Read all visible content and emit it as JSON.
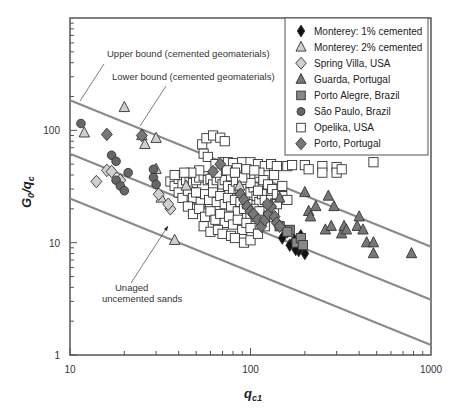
{
  "chart_data": {
    "type": "scatter",
    "title": "",
    "xlabel": "q_c1",
    "ylabel": "G0/qc",
    "xscale": "log",
    "yscale": "log",
    "xlim": [
      10,
      1000
    ],
    "ylim": [
      1,
      1000
    ],
    "x_ticks": [
      "10",
      "100",
      "1000"
    ],
    "y_ticks": [
      "1",
      "10",
      "100"
    ],
    "grid": false,
    "legend_position": "upper right",
    "lines": [
      {
        "name": "Upper bound (cemented geomaterials)",
        "points": [
          [
            10,
            185
          ],
          [
            1000,
            9.2
          ]
        ],
        "color": "#8a8a8a"
      },
      {
        "name": "Lower bound (cemented geomaterials)",
        "points": [
          [
            10,
            62
          ],
          [
            1000,
            3.1
          ]
        ],
        "color": "#8a8a8a"
      },
      {
        "name": "Unaged uncemented sands",
        "points": [
          [
            10,
            24.7
          ],
          [
            1000,
            1.23
          ]
        ],
        "color": "#8a8a8a"
      }
    ],
    "annotations": [
      {
        "text": "Upper bound (cemented geomaterials)",
        "x": 107,
        "y": 57
      },
      {
        "text": "Lower bound (cemented geomaterials)",
        "x": 112,
        "y": 80
      },
      {
        "text": "Unaged",
        "x": 115,
        "y": 291
      },
      {
        "text": "uncemented sands",
        "x": 102,
        "y": 302
      }
    ],
    "series": [
      {
        "name": "Monterey: 1% cemented",
        "marker": "diamond",
        "fill": "#111111",
        "points": [
          [
            150,
            11
          ],
          [
            165,
            9.5
          ],
          [
            175,
            10.5
          ],
          [
            185,
            8.5
          ],
          [
            190,
            11.5
          ],
          [
            200,
            8
          ],
          [
            160,
            12.5
          ],
          [
            178,
            8.7
          ]
        ]
      },
      {
        "name": "Monterey: 2% cemented",
        "marker": "triangle",
        "fill": "#cfcfcf",
        "points": [
          [
            12,
            95
          ],
          [
            20,
            160
          ],
          [
            26,
            75
          ],
          [
            30,
            85
          ],
          [
            25,
            90
          ],
          [
            32,
            25
          ],
          [
            38,
            10.5
          ],
          [
            130,
            22
          ],
          [
            44,
            32
          ],
          [
            87,
            32
          ],
          [
            30,
            45
          ]
        ]
      },
      {
        "name": "Spring Villa, USA",
        "marker": "diamond",
        "fill": "#d0d0d0",
        "points": [
          [
            14,
            35
          ],
          [
            16,
            44
          ],
          [
            19,
            36
          ],
          [
            31,
            27
          ],
          [
            36,
            20
          ],
          [
            17,
            43
          ],
          [
            35,
            22
          ]
        ]
      },
      {
        "name": "Guarda, Portugal",
        "marker": "triangle",
        "fill": "#777777",
        "points": [
          [
            145,
            25
          ],
          [
            200,
            28
          ],
          [
            210,
            19
          ],
          [
            215,
            17
          ],
          [
            230,
            21
          ],
          [
            260,
            13
          ],
          [
            280,
            14
          ],
          [
            290,
            21
          ],
          [
            320,
            12
          ],
          [
            330,
            14
          ],
          [
            340,
            13
          ],
          [
            390,
            14
          ],
          [
            420,
            13
          ],
          [
            440,
            10
          ],
          [
            480,
            8
          ],
          [
            480,
            10
          ],
          [
            780,
            8
          ],
          [
            400,
            17
          ],
          [
            270,
            26
          ]
        ]
      },
      {
        "name": "Porto Alegre, Brazil",
        "marker": "square",
        "fill": "#888888",
        "points": [
          [
            145,
            14
          ],
          [
            165,
            13
          ],
          [
            180,
            10
          ],
          [
            190,
            11
          ],
          [
            195,
            9.5
          ],
          [
            160,
            12.5
          ]
        ]
      },
      {
        "name": "São Paulo, Brazil",
        "marker": "circle",
        "fill": "#666666",
        "points": [
          [
            11.5,
            115
          ],
          [
            17,
            60
          ],
          [
            18,
            53
          ],
          [
            21,
            42
          ],
          [
            18,
            36
          ],
          [
            19,
            32
          ],
          [
            20,
            29
          ],
          [
            29,
            45
          ],
          [
            29,
            38
          ],
          [
            30,
            33
          ]
        ]
      },
      {
        "name": "Opelika, USA",
        "marker": "square",
        "fill": "#ffffff",
        "points": [
          [
            54,
            75
          ],
          [
            57,
            85
          ],
          [
            62,
            90
          ],
          [
            68,
            86
          ],
          [
            72,
            80
          ],
          [
            55,
            62
          ],
          [
            58,
            58
          ],
          [
            64,
            50
          ],
          [
            70,
            52
          ],
          [
            75,
            52
          ],
          [
            80,
            51
          ],
          [
            90,
            52
          ],
          [
            100,
            52
          ],
          [
            110,
            50
          ],
          [
            120,
            48
          ],
          [
            130,
            50
          ],
          [
            140,
            48
          ],
          [
            160,
            48
          ],
          [
            170,
            49
          ],
          [
            200,
            49
          ],
          [
            210,
            45
          ],
          [
            250,
            48
          ],
          [
            250,
            42
          ],
          [
            300,
            47
          ],
          [
            300,
            42
          ],
          [
            320,
            45
          ],
          [
            480,
            52
          ],
          [
            36,
            35
          ],
          [
            38,
            32
          ],
          [
            40,
            37
          ],
          [
            42,
            33
          ],
          [
            44,
            36
          ],
          [
            46,
            38
          ],
          [
            48,
            34
          ],
          [
            50,
            36
          ],
          [
            52,
            38
          ],
          [
            55,
            39
          ],
          [
            58,
            36
          ],
          [
            60,
            37
          ],
          [
            62,
            33
          ],
          [
            65,
            36
          ],
          [
            68,
            38
          ],
          [
            70,
            33
          ],
          [
            72,
            36
          ],
          [
            75,
            32
          ],
          [
            78,
            39
          ],
          [
            80,
            30
          ],
          [
            83,
            35
          ],
          [
            86,
            30
          ],
          [
            88,
            28
          ],
          [
            90,
            32
          ],
          [
            93,
            26
          ],
          [
            96,
            30
          ],
          [
            100,
            28
          ],
          [
            104,
            31
          ],
          [
            108,
            26
          ],
          [
            112,
            23
          ],
          [
            116,
            27
          ],
          [
            120,
            24
          ],
          [
            125,
            21
          ],
          [
            130,
            24
          ],
          [
            135,
            19
          ],
          [
            140,
            22
          ],
          [
            40,
            28
          ],
          [
            42,
            25
          ],
          [
            45,
            29
          ],
          [
            48,
            25
          ],
          [
            50,
            28
          ],
          [
            53,
            23
          ],
          [
            56,
            27
          ],
          [
            59,
            24
          ],
          [
            62,
            28
          ],
          [
            65,
            23
          ],
          [
            68,
            26
          ],
          [
            72,
            22
          ],
          [
            75,
            25
          ],
          [
            78,
            21
          ],
          [
            82,
            24
          ],
          [
            85,
            19
          ],
          [
            88,
            23
          ],
          [
            92,
            20
          ],
          [
            96,
            22
          ],
          [
            100,
            18
          ],
          [
            104,
            20
          ],
          [
            108,
            17
          ],
          [
            112,
            19
          ],
          [
            118,
            16
          ],
          [
            125,
            17
          ],
          [
            45,
            21
          ],
          [
            48,
            18
          ],
          [
            52,
            20
          ],
          [
            56,
            17
          ],
          [
            60,
            19
          ],
          [
            64,
            16
          ],
          [
            68,
            18
          ],
          [
            72,
            15
          ],
          [
            76,
            17
          ],
          [
            80,
            14.5
          ],
          [
            85,
            16
          ],
          [
            90,
            13
          ],
          [
            95,
            15
          ],
          [
            100,
            13.5
          ],
          [
            55,
            14
          ],
          [
            60,
            12.5
          ],
          [
            66,
            13
          ],
          [
            70,
            12
          ],
          [
            78,
            11.5
          ],
          [
            82,
            11
          ],
          [
            92,
            10
          ],
          [
            100,
            10.5
          ],
          [
            110,
            12
          ],
          [
            120,
            14
          ],
          [
            65,
            42
          ],
          [
            74,
            44
          ],
          [
            84,
            46
          ],
          [
            94,
            40
          ],
          [
            105,
            38
          ],
          [
            112,
            42
          ],
          [
            118,
            36
          ],
          [
            125,
            33
          ],
          [
            132,
            30
          ],
          [
            140,
            27
          ],
          [
            150,
            26
          ],
          [
            160,
            24
          ],
          [
            100,
            34
          ],
          [
            110,
            29
          ],
          [
            90,
            38
          ],
          [
            82,
            42
          ],
          [
            52,
            44
          ],
          [
            47,
            42
          ],
          [
            43,
            42
          ],
          [
            38,
            40
          ],
          [
            95,
            45
          ],
          [
            105,
            44
          ],
          [
            135,
            40
          ],
          [
            150,
            32
          ]
        ]
      },
      {
        "name": "Porto, Portugal",
        "marker": "diamond",
        "fill": "#777777",
        "points": [
          [
            16,
            92
          ],
          [
            25,
            90
          ],
          [
            68,
            50
          ],
          [
            88,
            27
          ],
          [
            92,
            24
          ],
          [
            96,
            21
          ],
          [
            100,
            19
          ],
          [
            104,
            18
          ],
          [
            110,
            16
          ],
          [
            115,
            14
          ],
          [
            120,
            16
          ],
          [
            126,
            18
          ],
          [
            130,
            21
          ],
          [
            136,
            17
          ],
          [
            140,
            15
          ],
          [
            145,
            14
          ],
          [
            124,
            22
          ],
          [
            62,
            43
          ]
        ]
      }
    ]
  },
  "legend": {
    "items": [
      {
        "label": "Monterey: 1% cemented"
      },
      {
        "label": "Monterey: 2% cemented"
      },
      {
        "label": "Spring Villa, USA"
      },
      {
        "label": "Guarda, Portugal"
      },
      {
        "label": "Porto Alegre, Brazil"
      },
      {
        "label": "São Paulo, Brazil"
      },
      {
        "label": "Opelika, USA"
      },
      {
        "label": "Porto, Portugal"
      }
    ]
  },
  "axes": {
    "x_title_main": "q",
    "x_title_sub": "c1",
    "y_title_main": "G",
    "y_title_sub0": "0",
    "y_title_slash": "/q",
    "y_title_sub1": "c"
  }
}
